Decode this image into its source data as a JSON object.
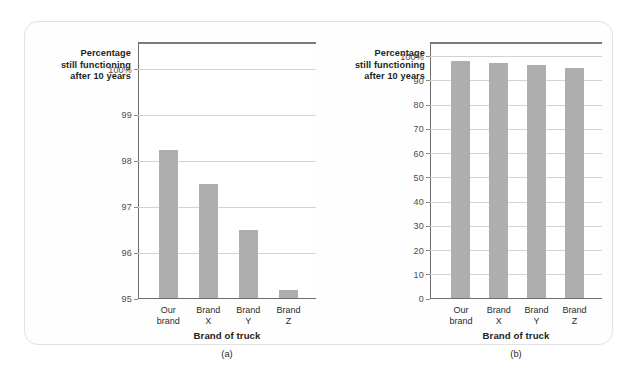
{
  "figure": {
    "background_color": "#ffffff",
    "card_color": "#fefefe",
    "card_border_color": "#e2e2e2",
    "bar_color": "#aeaeae",
    "gridline_color": "#d3d3d3",
    "axis_color": "#6e6e6e"
  },
  "chart_data": [
    {
      "type": "bar",
      "id": "a",
      "caption": "(a)",
      "title": "",
      "xlabel": "Brand of truck",
      "ylabel": "Percentage\nstill functioning\nafter 10 years",
      "ylabel_lines": [
        "Percentage",
        "still functioning",
        "after 10 years"
      ],
      "categories": [
        "Our brand",
        "Brand X",
        "Brand Y",
        "Brand Z"
      ],
      "category_lines": [
        [
          "Our",
          "brand"
        ],
        [
          "Brand",
          "X"
        ],
        [
          "Brand",
          "Y"
        ],
        [
          "Brand",
          "Z"
        ]
      ],
      "values": [
        98.25,
        97.5,
        96.5,
        95.2
      ],
      "ylim": [
        95,
        100.6
      ],
      "yticks": [
        95,
        96,
        97,
        98,
        99,
        100
      ],
      "ytick_labels": [
        "95",
        "96",
        "97",
        "98",
        "99",
        "100%"
      ],
      "grid": true,
      "legend": "none"
    },
    {
      "type": "bar",
      "id": "b",
      "caption": "(b)",
      "title": "",
      "xlabel": "Brand of truck",
      "ylabel": "Percentage\nstill functioning\nafter 10 years",
      "ylabel_lines": [
        "Percentage",
        "still functioning",
        "after 10 years"
      ],
      "categories": [
        "Our brand",
        "Brand X",
        "Brand Y",
        "Brand Z"
      ],
      "category_lines": [
        [
          "Our",
          "brand"
        ],
        [
          "Brand",
          "X"
        ],
        [
          "Brand",
          "Y"
        ],
        [
          "Brand",
          "Z"
        ]
      ],
      "values": [
        98.25,
        97.5,
        96.5,
        95.2
      ],
      "ylim": [
        0,
        106
      ],
      "yticks": [
        0,
        10,
        20,
        30,
        40,
        50,
        60,
        70,
        80,
        90,
        100
      ],
      "ytick_labels": [
        "0",
        "10",
        "20",
        "30",
        "40",
        "50",
        "60",
        "70",
        "80",
        "90",
        "100%"
      ],
      "grid": true,
      "legend": "none"
    }
  ]
}
